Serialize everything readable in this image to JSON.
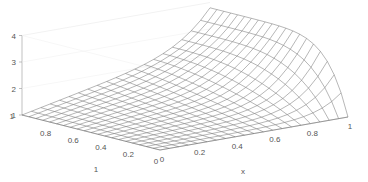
{
  "chart_data": {
    "type": "surface",
    "title": "",
    "xlabel": "x",
    "ylabel": "",
    "zlabel": "",
    "x_ticks": [
      "0",
      "0.2",
      "0.4",
      "0.6",
      "0.8",
      "1"
    ],
    "y_ticks": [
      "0",
      "0.2",
      "0.4",
      "0.6",
      "0.8",
      "1"
    ],
    "z_ticks": [
      "1",
      "2",
      "3",
      "4"
    ],
    "xlim": [
      0,
      1
    ],
    "ylim": [
      0,
      1
    ],
    "zlim": [
      1,
      4
    ],
    "grid_resolution": 20,
    "surface_description": "z = 1 along x=0 and y=0 edges, rising to ~3.8 at x=1,y=1; steep rise near x=1 edge",
    "sample_points": [
      {
        "x": 0,
        "y": 0,
        "z": 1
      },
      {
        "x": 1,
        "y": 0,
        "z": 1
      },
      {
        "x": 0,
        "y": 1,
        "z": 1
      },
      {
        "x": 0.5,
        "y": 0.5,
        "z": 1.8
      },
      {
        "x": 1,
        "y": 0.5,
        "z": 3.4
      },
      {
        "x": 1,
        "y": 1,
        "z": 3.8
      }
    ],
    "line_color": "#6e6e6e",
    "axis_color": "#999999"
  }
}
